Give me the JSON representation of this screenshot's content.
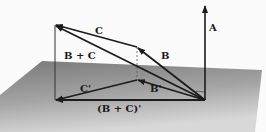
{
  "diagram": {
    "colors": {
      "background": "#fbfbfb",
      "plane_light": "#d4d4d4",
      "plane_dark": "#7a7a7a",
      "vector": "#1c1c1c",
      "dashed": "#555555"
    },
    "labels": {
      "A": "A",
      "B": "B",
      "C": "C",
      "B_plus_C": "B + C",
      "B_prime": "B'",
      "C_prime": "C'",
      "B_plus_C_prime": "(B + C)'"
    },
    "vectors": [
      {
        "name": "A",
        "from": [
          205,
          100
        ],
        "to": [
          205,
          5
        ]
      },
      {
        "name": "B",
        "from": [
          205,
          100
        ],
        "to": [
          137,
          47
        ]
      },
      {
        "name": "C",
        "from": [
          137,
          47
        ],
        "to": [
          55,
          25
        ]
      },
      {
        "name": "B + C",
        "from": [
          205,
          100
        ],
        "to": [
          55,
          25
        ]
      },
      {
        "name": "B'",
        "from": [
          205,
          100
        ],
        "to": [
          137,
          80
        ]
      },
      {
        "name": "C'",
        "from": [
          137,
          80
        ],
        "to": [
          55,
          100
        ]
      },
      {
        "name": "(B + C)'",
        "from": [
          205,
          100
        ],
        "to": [
          55,
          100
        ]
      }
    ],
    "projection_lines": [
      {
        "from": [
          55,
          25
        ],
        "to": [
          55,
          100
        ],
        "style": "solid"
      },
      {
        "from": [
          137,
          47
        ],
        "to": [
          137,
          80
        ],
        "style": "dashed"
      }
    ]
  }
}
